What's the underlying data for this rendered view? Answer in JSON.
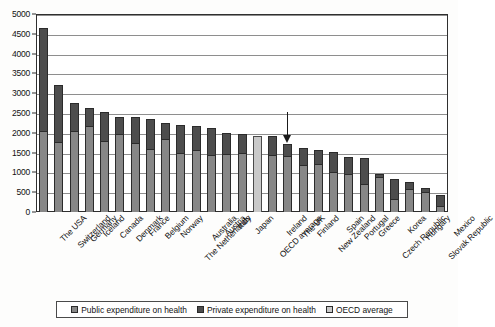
{
  "chart_data": {
    "type": "bar",
    "subtype": "stacked-bar",
    "title": "",
    "xlabel": "",
    "ylabel": "",
    "ylim": [
      0,
      5000
    ],
    "ytick_step": 500,
    "yticks": [
      "0",
      "500",
      "1000",
      "1500",
      "2000",
      "2500",
      "3000",
      "3500",
      "4000",
      "4500",
      "5000"
    ],
    "grid": true,
    "legend_position": "bottom",
    "categories": [
      "The USA",
      "Switzerland",
      "Germany",
      "Iceland",
      "Canada",
      "Denmark",
      "France",
      "Belgium",
      "Norway",
      "The Netherlands",
      "Australia",
      "Austria",
      "Italy",
      "Japan",
      "OECD average",
      "Ireland",
      "The UK",
      "Finland",
      "New Zealand",
      "Spain",
      "Portugal",
      "Greece",
      "Czech Republic",
      "Korea",
      "Hungary",
      "Slovak Republic",
      "Mexico"
    ],
    "series": [
      {
        "name": "Public expenditure on health",
        "color": "#878787",
        "values": [
          2040,
          1770,
          2050,
          2180,
          1800,
          1960,
          1740,
          1580,
          1840,
          1480,
          1560,
          1450,
          1470,
          1500,
          1930,
          1440,
          1410,
          1190,
          1210,
          1020,
          950,
          710,
          890,
          340,
          570,
          510,
          160
        ]
      },
      {
        "name": "Private expenditure on health",
        "color": "#4d4d4d",
        "values": [
          2600,
          1450,
          700,
          440,
          730,
          450,
          670,
          760,
          400,
          730,
          610,
          680,
          530,
          470,
          0,
          470,
          320,
          430,
          360,
          490,
          430,
          650,
          80,
          490,
          200,
          100,
          280
        ]
      }
    ],
    "totals": [
      4640,
      3220,
      2750,
      2620,
      2530,
      2410,
      2340,
      2240,
      2240,
      2210,
      2170,
      2130,
      2000,
      1970,
      1930,
      1910,
      1730,
      1620,
      1570,
      1510,
      1380,
      1360,
      970,
      830,
      770,
      610,
      440
    ],
    "oecd_average_category": "OECD average",
    "oecd_average_value": 1930,
    "oecd_average_color": "#c9c9c9",
    "annotation": {
      "label": "arrow-pointing-to-the-uk",
      "target_category": "The UK",
      "target_value": 1730
    },
    "legend": [
      {
        "label": "Public expenditure on health",
        "swatch": "#878787",
        "icon": "legend-swatch-icon"
      },
      {
        "label": "Private expenditure on health",
        "swatch": "#4d4d4d",
        "icon": "legend-swatch-icon"
      },
      {
        "label": "OECD average",
        "swatch": "#c9c9c9",
        "icon": "legend-swatch-icon"
      }
    ]
  }
}
